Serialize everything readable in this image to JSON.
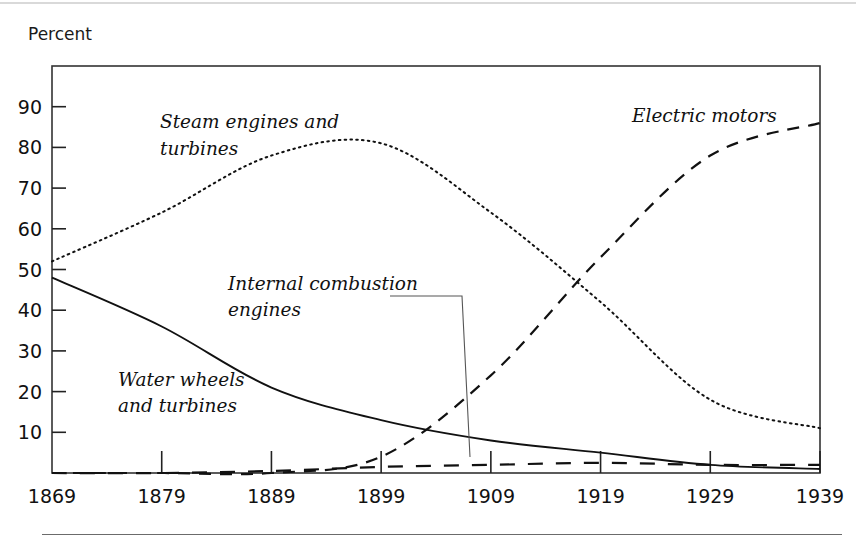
{
  "page": {
    "axis_unit_label": "Percent",
    "background_color": "#ffffff",
    "ink_color": "#111111"
  },
  "chart_data": {
    "type": "line",
    "title": "",
    "subtitle": "",
    "xlabel": "",
    "ylabel": "Percent",
    "grid": false,
    "legend_position": "inline-annotations",
    "x": [
      1869,
      1879,
      1889,
      1899,
      1909,
      1919,
      1929,
      1939
    ],
    "x_tick_labels": [
      "1869",
      "1879",
      "1889",
      "1899",
      "1909",
      "1919",
      "1929",
      "1939"
    ],
    "xlim": [
      1869,
      1939
    ],
    "ylim": [
      0,
      100
    ],
    "y_tick_labels": [
      "10",
      "20",
      "30",
      "40",
      "50",
      "60",
      "70",
      "80",
      "90"
    ],
    "y_ticks": [
      10,
      20,
      30,
      40,
      50,
      60,
      70,
      80,
      90
    ],
    "series": [
      {
        "name": "Steam engines and turbines",
        "style": "dotted",
        "label": "Steam engines and\nturbines",
        "label_lines": [
          "Steam engines and",
          "turbines"
        ],
        "values": [
          52,
          64,
          78,
          81,
          64,
          42,
          18,
          11
        ]
      },
      {
        "name": "Water wheels and turbines",
        "style": "solid",
        "label": "Water wheels\nand turbines",
        "label_lines": [
          "Water wheels",
          "and turbines"
        ],
        "values": [
          48,
          36,
          21,
          13,
          8,
          5,
          2,
          1
        ]
      },
      {
        "name": "Electric motors",
        "style": "dashed",
        "label": "Electric motors",
        "label_lines": [
          "Electric motors"
        ],
        "values": [
          0,
          0,
          0,
          4,
          24,
          53,
          78,
          86
        ]
      },
      {
        "name": "Internal combustion engines",
        "style": "long-dashed",
        "label": "Internal combustion\nengines",
        "label_lines": [
          "Internal combustion",
          "engines"
        ],
        "values": [
          0,
          0,
          0.5,
          1.5,
          2,
          2.5,
          2,
          2
        ]
      }
    ],
    "annotations": [
      {
        "text": "Steam engines and turbines",
        "x": 1880,
        "y": 86
      },
      {
        "text": "Water wheels and turbines",
        "x": 1875,
        "y": 22
      },
      {
        "text": "Internal combustion engines",
        "x": 1881,
        "y": 45
      },
      {
        "text": "Electric motors",
        "x": 1924,
        "y": 89
      }
    ]
  }
}
